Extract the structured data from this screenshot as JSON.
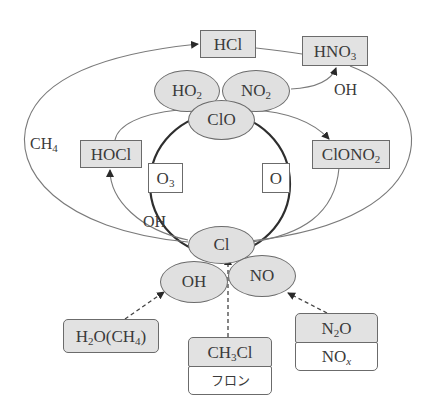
{
  "diagram": {
    "type": "chlorine-ozone-reaction-cycle",
    "colors": {
      "node_fill": "#e0e0e0",
      "stroke": "#6b6b6b",
      "text": "#3a3a3a",
      "background": "#ffffff"
    },
    "reservoirs": {
      "hcl": {
        "base": "HCl"
      },
      "hno3": {
        "base": "HNO",
        "sub": "3"
      },
      "hocl": {
        "base": "HOCl"
      },
      "clono2": {
        "base": "ClONO",
        "sub": "2"
      }
    },
    "radicals": {
      "ho2": {
        "base": "HO",
        "sub": "2"
      },
      "no2": {
        "base": "NO",
        "sub": "2"
      },
      "clo": {
        "base": "ClO"
      },
      "cl": {
        "base": "Cl"
      },
      "oh": {
        "base": "OH"
      },
      "no": {
        "base": "NO"
      }
    },
    "cycle_reactants": {
      "o3": {
        "base": "O",
        "sub": "3"
      },
      "o": {
        "base": "O"
      }
    },
    "edge_labels": {
      "ch4": {
        "base": "CH",
        "sub": "4"
      },
      "oh_top": "OH",
      "oh_left": "OH"
    },
    "sources": {
      "h2o_ch4": {
        "a": "H",
        "a_sub": "2",
        "b": "O(CH",
        "b_sub": "4",
        "c": ")"
      },
      "ch3cl": {
        "a": "CH",
        "a_sub": "3",
        "b": "Cl"
      },
      "freon": "フロン",
      "n2o": {
        "a": "N",
        "a_sub": "2",
        "b": "O"
      },
      "nox": {
        "base": "NO",
        "sub": "x"
      }
    }
  }
}
